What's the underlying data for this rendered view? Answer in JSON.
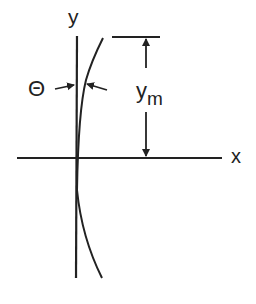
{
  "diagram": {
    "type": "geometric sketch",
    "labels": {
      "y_axis": "y",
      "x_axis": "x",
      "angle": "Θ",
      "dimension_base": "y",
      "dimension_sub": "m"
    },
    "colors": {
      "stroke": "#222222",
      "background": "#ffffff"
    },
    "elements": [
      "vertical y-axis",
      "horizontal x-axis",
      "curved profile line departing from y-axis",
      "angle Θ between y-axis and curve tangent",
      "dimension arrow y_m from x-axis to top reference line"
    ]
  }
}
